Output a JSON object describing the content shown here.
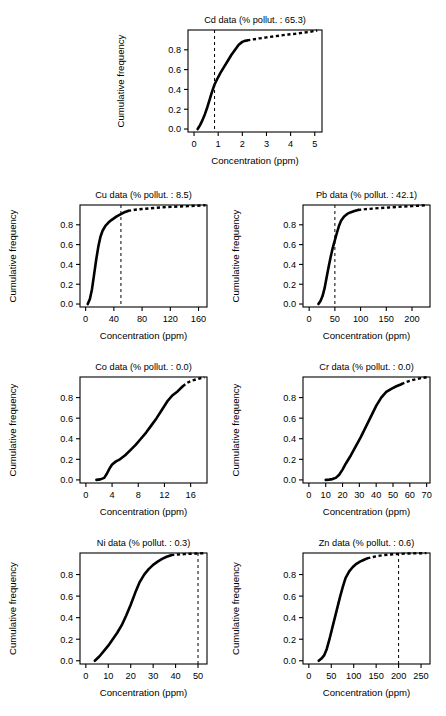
{
  "figure": {
    "axis_labels": {
      "x": "Concentration (ppm)",
      "y": "Cumulative frequency"
    },
    "y_ticks": [
      "0.0",
      "0.2",
      "0.4",
      "0.6",
      "0.8"
    ]
  },
  "chart_data": [
    {
      "type": "line",
      "element": "Cd",
      "title": "Cd data (% pollut. : 65.3)",
      "percent_pollutant": 65.3,
      "xlabel": "Concentration (ppm)",
      "ylabel": "Cumulative frequency",
      "xlim": [
        -0.25,
        5.3
      ],
      "ylim": [
        -0.03,
        1.0
      ],
      "grid": false,
      "legend": "none",
      "x_ticks": [
        "0",
        "1",
        "2",
        "3",
        "4",
        "5"
      ],
      "x_tick_values": [
        0,
        1,
        2,
        3,
        4,
        5
      ],
      "y_ticks": [
        "0.0",
        "0.2",
        "0.4",
        "0.6",
        "0.8"
      ],
      "y_tick_values": [
        0.0,
        0.2,
        0.4,
        0.6,
        0.8
      ],
      "threshold_line": 0.85,
      "x": [
        0.15,
        0.25,
        0.35,
        0.45,
        0.55,
        0.65,
        0.75,
        0.85,
        0.95,
        1.1,
        1.25,
        1.4,
        1.55,
        1.7,
        1.85,
        2.0,
        2.1,
        2.2
      ],
      "y": [
        0.0,
        0.04,
        0.09,
        0.15,
        0.22,
        0.3,
        0.38,
        0.45,
        0.5,
        0.57,
        0.63,
        0.69,
        0.75,
        0.8,
        0.85,
        0.88,
        0.89,
        0.895
      ],
      "tail_x": [
        2.2,
        2.45,
        2.7,
        3.0,
        3.3,
        3.6,
        3.9,
        4.2,
        4.5,
        4.8,
        5.1
      ],
      "tail_y": [
        0.895,
        0.905,
        0.915,
        0.925,
        0.935,
        0.945,
        0.955,
        0.962,
        0.972,
        0.982,
        0.995
      ]
    },
    {
      "type": "line",
      "element": "Cu",
      "title": "Cu data (% pollut. : 8.5)",
      "percent_pollutant": 8.5,
      "xlabel": "Concentration (ppm)",
      "ylabel": "Cumulative frequency",
      "xlim": [
        -8,
        172
      ],
      "ylim": [
        -0.03,
        1.0
      ],
      "grid": false,
      "legend": "none",
      "x_ticks": [
        "0",
        "40",
        "80",
        "120",
        "160"
      ],
      "x_tick_values": [
        0,
        40,
        80,
        120,
        160
      ],
      "y_ticks": [
        "0.0",
        "0.2",
        "0.4",
        "0.6",
        "0.8"
      ],
      "y_tick_values": [
        0.0,
        0.2,
        0.4,
        0.6,
        0.8
      ],
      "threshold_line": 50,
      "x": [
        3,
        6,
        9,
        12,
        15,
        18,
        21,
        24,
        28,
        32,
        36,
        40,
        44,
        48,
        52,
        56,
        60
      ],
      "y": [
        0.0,
        0.05,
        0.15,
        0.3,
        0.45,
        0.58,
        0.68,
        0.74,
        0.79,
        0.82,
        0.845,
        0.865,
        0.885,
        0.9,
        0.915,
        0.93,
        0.94
      ],
      "tail_x": [
        60,
        70,
        80,
        90,
        100,
        110,
        120,
        132,
        145,
        158,
        170
      ],
      "tail_y": [
        0.94,
        0.952,
        0.96,
        0.966,
        0.972,
        0.977,
        0.981,
        0.985,
        0.989,
        0.993,
        0.997
      ]
    },
    {
      "type": "line",
      "element": "Pb",
      "title": "Pb data (% pollut. : 42.1)",
      "percent_pollutant": 42.1,
      "xlabel": "Concentration (ppm)",
      "ylabel": "Cumulative frequency",
      "xlim": [
        -12,
        235
      ],
      "ylim": [
        -0.03,
        1.0
      ],
      "grid": false,
      "legend": "none",
      "x_ticks": [
        "0",
        "50",
        "100",
        "150",
        "200"
      ],
      "x_tick_values": [
        0,
        50,
        100,
        150,
        200
      ],
      "y_ticks": [
        "0.0",
        "0.2",
        "0.4",
        "0.6",
        "0.8"
      ],
      "y_tick_values": [
        0.0,
        0.2,
        0.4,
        0.6,
        0.8
      ],
      "threshold_line": 50,
      "x": [
        18,
        22,
        26,
        30,
        34,
        38,
        42,
        46,
        50,
        54,
        58,
        62,
        68,
        74,
        80,
        88,
        95
      ],
      "y": [
        0.0,
        0.03,
        0.08,
        0.16,
        0.27,
        0.38,
        0.48,
        0.57,
        0.645,
        0.72,
        0.79,
        0.84,
        0.885,
        0.91,
        0.925,
        0.94,
        0.95
      ],
      "tail_x": [
        95,
        110,
        125,
        140,
        155,
        170,
        185,
        200,
        215,
        230
      ],
      "tail_y": [
        0.95,
        0.958,
        0.964,
        0.97,
        0.975,
        0.98,
        0.985,
        0.989,
        0.993,
        0.998
      ]
    },
    {
      "type": "line",
      "element": "Co",
      "title": "Co data (% pollut. : 0.0)",
      "percent_pollutant": 0.0,
      "xlabel": "Concentration (ppm)",
      "ylabel": "Cumulative frequency",
      "xlim": [
        -0.9,
        18.5
      ],
      "ylim": [
        -0.03,
        1.0
      ],
      "grid": false,
      "legend": "none",
      "x_ticks": [
        "0",
        "4",
        "8",
        "12",
        "16"
      ],
      "x_tick_values": [
        0,
        4,
        8,
        12,
        16
      ],
      "y_ticks": [
        "0.0",
        "0.2",
        "0.4",
        "0.6",
        "0.8"
      ],
      "y_tick_values": [
        0.0,
        0.2,
        0.4,
        0.6,
        0.8
      ],
      "threshold_line": null,
      "x": [
        1.6,
        2.2,
        2.8,
        3.2,
        3.6,
        4.0,
        4.6,
        5.2,
        6.0,
        6.8,
        7.6,
        8.4,
        9.2,
        10.0,
        10.8,
        11.6,
        12.4,
        13.2,
        14.0,
        14.8
      ],
      "y": [
        0.0,
        0.005,
        0.02,
        0.06,
        0.11,
        0.15,
        0.18,
        0.2,
        0.24,
        0.29,
        0.34,
        0.4,
        0.46,
        0.53,
        0.6,
        0.68,
        0.76,
        0.82,
        0.86,
        0.91
      ],
      "tail_x": [
        14.8,
        15.5,
        16.2,
        16.9,
        17.5,
        18.1
      ],
      "tail_y": [
        0.91,
        0.945,
        0.965,
        0.978,
        0.988,
        0.996
      ]
    },
    {
      "type": "line",
      "element": "Cr",
      "title": "Cr data (% pollut. : 0.0)",
      "percent_pollutant": 0.0,
      "xlabel": "Concentration (ppm)",
      "ylabel": "Cumulative frequency",
      "xlim": [
        -3.5,
        72
      ],
      "ylim": [
        -0.03,
        1.0
      ],
      "grid": false,
      "legend": "none",
      "x_ticks": [
        "0",
        "10",
        "20",
        "30",
        "40",
        "50",
        "60",
        "70"
      ],
      "x_tick_values": [
        0,
        10,
        20,
        30,
        40,
        50,
        60,
        70
      ],
      "y_ticks": [
        "0.0",
        "0.2",
        "0.4",
        "0.6",
        "0.8"
      ],
      "y_tick_values": [
        0.0,
        0.2,
        0.4,
        0.6,
        0.8
      ],
      "threshold_line": null,
      "x": [
        10,
        12,
        14,
        16,
        18,
        20,
        22,
        25,
        28,
        31,
        34,
        37,
        40,
        43,
        46,
        49,
        52,
        55
      ],
      "y": [
        0.0,
        0.003,
        0.008,
        0.02,
        0.05,
        0.1,
        0.16,
        0.24,
        0.33,
        0.42,
        0.52,
        0.62,
        0.72,
        0.8,
        0.855,
        0.885,
        0.91,
        0.93
      ],
      "tail_x": [
        55,
        58,
        61,
        64,
        67,
        70
      ],
      "tail_y": [
        0.93,
        0.952,
        0.968,
        0.98,
        0.99,
        0.997
      ]
    },
    {
      "type": "line",
      "element": "Ni",
      "title": "Ni data (% pollut. : 0.3)",
      "percent_pollutant": 0.3,
      "xlabel": "Concentration (ppm)",
      "ylabel": "Cumulative frequency",
      "xlim": [
        -2.6,
        54
      ],
      "ylim": [
        -0.03,
        1.0
      ],
      "grid": false,
      "legend": "none",
      "x_ticks": [
        "0",
        "10",
        "20",
        "30",
        "40",
        "50"
      ],
      "x_tick_values": [
        0,
        10,
        20,
        30,
        40,
        50
      ],
      "y_ticks": [
        "0.0",
        "0.2",
        "0.4",
        "0.6",
        "0.8"
      ],
      "y_tick_values": [
        0.0,
        0.2,
        0.4,
        0.6,
        0.8
      ],
      "threshold_line": 50,
      "x": [
        4,
        6,
        8,
        10,
        12,
        14,
        16,
        18,
        20,
        22,
        24,
        26,
        28,
        30,
        32,
        34,
        36,
        38
      ],
      "y": [
        0.0,
        0.04,
        0.09,
        0.14,
        0.2,
        0.26,
        0.33,
        0.42,
        0.52,
        0.63,
        0.73,
        0.8,
        0.85,
        0.89,
        0.92,
        0.945,
        0.965,
        0.98
      ],
      "tail_x": [
        38,
        41,
        44,
        47,
        50,
        53
      ],
      "tail_y": [
        0.98,
        0.986,
        0.99,
        0.993,
        0.996,
        0.999
      ]
    },
    {
      "type": "line",
      "element": "Zn",
      "title": "Zn data (% pollut. : 0.6)",
      "percent_pollutant": 0.6,
      "xlabel": "Concentration (ppm)",
      "ylabel": "Cumulative frequency",
      "xlim": [
        -13,
        270
      ],
      "ylim": [
        -0.03,
        1.0
      ],
      "grid": false,
      "legend": "none",
      "x_ticks": [
        "0",
        "50",
        "100",
        "150",
        "200",
        "250"
      ],
      "x_tick_values": [
        0,
        50,
        100,
        150,
        200,
        250
      ],
      "y_ticks": [
        "0.0",
        "0.2",
        "0.4",
        "0.6",
        "0.8"
      ],
      "y_tick_values": [
        0.0,
        0.2,
        0.4,
        0.6,
        0.8
      ],
      "threshold_line": 200,
      "x": [
        22,
        28,
        34,
        40,
        46,
        52,
        58,
        64,
        70,
        76,
        82,
        90,
        98,
        106,
        114,
        122,
        130
      ],
      "y": [
        0.0,
        0.02,
        0.05,
        0.11,
        0.2,
        0.3,
        0.4,
        0.5,
        0.6,
        0.69,
        0.77,
        0.83,
        0.87,
        0.9,
        0.92,
        0.935,
        0.95
      ],
      "tail_x": [
        130,
        142,
        154,
        166,
        178,
        190,
        205,
        220,
        240,
        262
      ],
      "tail_y": [
        0.95,
        0.962,
        0.972,
        0.98,
        0.985,
        0.989,
        0.992,
        0.995,
        0.997,
        0.999
      ]
    }
  ],
  "panel_layout": [
    {
      "element": "Cd",
      "left": 108,
      "top": 8,
      "width": 230,
      "height": 172
    },
    {
      "element": "Cu",
      "left": 0,
      "top": 183,
      "width": 223,
      "height": 172
    },
    {
      "element": "Pb",
      "left": 223,
      "top": 183,
      "width": 223,
      "height": 172
    },
    {
      "element": "Co",
      "left": 0,
      "top": 355,
      "width": 223,
      "height": 176
    },
    {
      "element": "Cr",
      "left": 223,
      "top": 355,
      "width": 223,
      "height": 176
    },
    {
      "element": "Ni",
      "left": 0,
      "top": 531,
      "width": 223,
      "height": 181
    },
    {
      "element": "Zn",
      "left": 223,
      "top": 531,
      "width": 223,
      "height": 181
    }
  ]
}
